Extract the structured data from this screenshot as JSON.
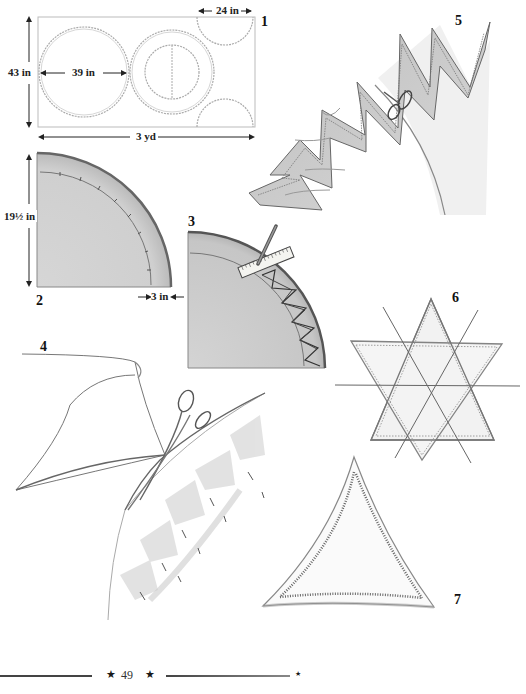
{
  "page": {
    "number": "49",
    "footer_ornament": "★"
  },
  "figures": [
    {
      "id": "1",
      "label": "1",
      "description": "Cutting layout on fabric",
      "dimensions": {
        "height": "43 in",
        "circle_diameter": "39 in",
        "half_circle_width": "24 in",
        "length": "3 yd"
      }
    },
    {
      "id": "2",
      "label": "2",
      "description": "Quarter-circle pattern",
      "dimensions": {
        "radius": "19½ in",
        "border": "3 in"
      }
    },
    {
      "id": "3",
      "label": "3",
      "description": "Marking zigzag border with ruler and pencil"
    },
    {
      "id": "4",
      "label": "4",
      "description": "Cutting the fabric with scissors along pinned zigzag"
    },
    {
      "id": "5",
      "label": "5",
      "description": "Cutting zigzag edge with scissors"
    },
    {
      "id": "6",
      "label": "6",
      "description": "Six-pointed star shape"
    },
    {
      "id": "7",
      "label": "7",
      "description": "Triangle with zigzag stitching"
    }
  ],
  "colors": {
    "ink": "#222222",
    "shade": "#c8c8c8",
    "stitch": "#555555",
    "paper": "#ffffff"
  }
}
